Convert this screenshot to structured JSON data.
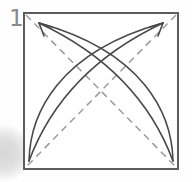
{
  "step": {
    "label": "1"
  },
  "colors": {
    "background": "#fefefe",
    "paper_fill": "#ffffff",
    "paper_outline": "#5c5c5c",
    "crease_line": "#9b9b9b",
    "arrow_line": "#494949",
    "step_label": "#8a8a8a",
    "page_shadow": "#d7d7d7"
  },
  "paper": {
    "shape": "square",
    "outline_d": "M 24 13 H 178 V 169 H 24 Z"
  },
  "creases": {
    "style": "dashed-valley-fold",
    "diagonal_tl_br_d": "M 26 15 L 176 167",
    "diagonal_tr_bl_d": "M 176 15 L 26 167"
  },
  "arrows": {
    "fold_bl_to_tr": {
      "meaning": "fold bottom-left corner to top-right corner",
      "outer_d": "M 29 161 C 30 114, 58 52, 163 23",
      "inner_d": "M 29 161 C 45 118, 80 62, 163 23",
      "head_d": "M 150 27 L 163 23 L 158 36"
    },
    "fold_br_to_tl": {
      "meaning": "fold bottom-right corner to top-left corner",
      "outer_d": "M 173 161 C 172 114, 144 52, 39 23",
      "inner_d": "M 173 161 C 157 118, 122 62, 39 23",
      "head_d": "M 52 27 L 39 23 L 44 36"
    }
  }
}
